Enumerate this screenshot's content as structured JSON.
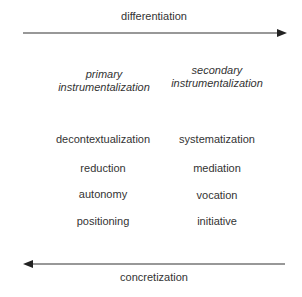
{
  "top_arrow": {
    "label": "differentiation",
    "direction": "right"
  },
  "bottom_arrow": {
    "label": "concretization",
    "direction": "left"
  },
  "columns": [
    {
      "heading": [
        "primary",
        "instrumentalization"
      ],
      "items": [
        "decontextualization",
        "reduction",
        "autonomy",
        "positioning"
      ]
    },
    {
      "heading": [
        "secondary",
        "instrumentalization"
      ],
      "items": [
        "systematization",
        "mediation",
        "vocation",
        "initiative"
      ]
    }
  ],
  "colors": {
    "line": "#333333",
    "text": "#333333"
  }
}
